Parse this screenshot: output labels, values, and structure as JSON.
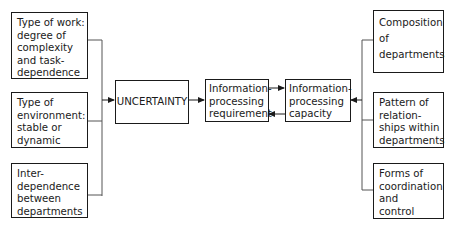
{
  "diagram": {
    "left_boxes": [
      {
        "lines": [
          "Type of work:",
          "degree of",
          "complexity",
          "and task-",
          "dependence"
        ]
      },
      {
        "lines": [
          "Type of",
          "environment:",
          "stable or",
          "dynamic"
        ]
      },
      {
        "lines": [
          "Inter-",
          "dependence",
          "between",
          "departments"
        ]
      }
    ],
    "uncertainty": {
      "label": "UNCERTAINTY"
    },
    "info_requirement": {
      "lines": [
        "Information-",
        "processing",
        "requirement"
      ]
    },
    "info_capacity": {
      "lines": [
        "Information-",
        "processing",
        "capacity"
      ]
    },
    "right_boxes": [
      {
        "lines": [
          "Composition",
          "of",
          "departments"
        ]
      },
      {
        "lines": [
          "Pattern of",
          "relation-",
          "ships within",
          "departments"
        ]
      },
      {
        "lines": [
          "Forms of",
          "coordination",
          "and",
          "control"
        ]
      }
    ],
    "edges": [
      {
        "from": "left_boxes",
        "to": "uncertainty"
      },
      {
        "from": "uncertainty",
        "to": "info_requirement"
      },
      {
        "from": "info_requirement",
        "to": "info_capacity"
      },
      {
        "from": "info_capacity",
        "to": "info_requirement"
      },
      {
        "from": "right_boxes",
        "to": "info_capacity"
      }
    ]
  }
}
